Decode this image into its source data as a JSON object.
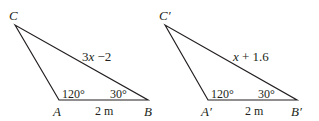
{
  "diagram": {
    "type": "similar-triangles",
    "stroke_color": "#231f20",
    "triangles": [
      {
        "id": "ABC",
        "vertices": {
          "C": {
            "label": "C",
            "x": 15,
            "y": 25
          },
          "A": {
            "label": "A",
            "x": 59,
            "y": 100
          },
          "B": {
            "label": "B",
            "x": 148,
            "y": 100
          }
        },
        "angle_A": "120°",
        "angle_B": "30°",
        "side_AB": "2 m",
        "side_CB": "3x − 2"
      },
      {
        "id": "A'B'C'",
        "vertices": {
          "C": {
            "label": "C′",
            "x": 165,
            "y": 25
          },
          "A": {
            "label": "A′",
            "x": 208,
            "y": 100
          },
          "B": {
            "label": "B′",
            "x": 297,
            "y": 100
          }
        },
        "angle_A": "120°",
        "angle_B": "30°",
        "side_AB": "2 m",
        "side_CB": "x + 1.6"
      }
    ]
  },
  "labels": {
    "t1_C": "C",
    "t1_A": "A",
    "t1_B": "B",
    "t1_angleA": "120°",
    "t1_angleB": "30°",
    "t1_base": "2 m",
    "t1_hyp": "3x −2",
    "t2_C": "C′",
    "t2_A": "A′",
    "t2_B": "B′",
    "t2_angleA": "120°",
    "t2_angleB": "30°",
    "t2_base": "2 m",
    "t2_hyp": "x + 1.6"
  }
}
